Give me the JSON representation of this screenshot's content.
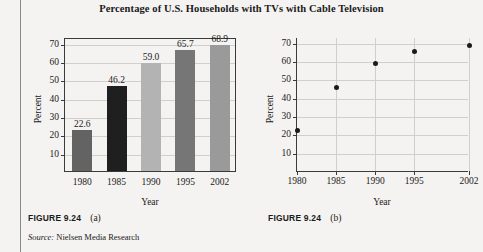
{
  "figure": {
    "title": "Percentage of U.S. Households with TVs with Cable Television",
    "caption_a": {
      "label": "FIGURE 9.24",
      "part": "(a)"
    },
    "caption_b": {
      "label": "FIGURE 9.24",
      "part": "(b)"
    },
    "source": {
      "word": "Source:",
      "text": " Nielsen Media Research"
    },
    "page_background": "#f4f3f1",
    "ink_color": "#1a1a1a"
  },
  "chart_data": [
    {
      "type": "bar",
      "id": "figure-9-24-a",
      "title": "Percentage of U.S. Households with TVs with Cable Television",
      "categories": [
        "1980",
        "1985",
        "1990",
        "1995",
        "2002"
      ],
      "values": [
        22.6,
        46.2,
        59.0,
        65.7,
        68.9
      ],
      "data_labels": [
        "22.6",
        "46.2",
        "59.0",
        "65.7",
        "68.9"
      ],
      "bar_colors": [
        "#636363",
        "#1f1f1f",
        "#b3b3b3",
        "#767676",
        "#9a9a9a"
      ],
      "xlabel": "Year",
      "ylabel": "Percent",
      "ylim": [
        0,
        73
      ],
      "yticks": [
        10,
        20,
        30,
        40,
        50,
        60,
        70
      ],
      "ytick_labels": [
        "10",
        "20",
        "30",
        "40",
        "50",
        "60",
        "70"
      ],
      "grid": true,
      "grid_axis": "y",
      "legend": "none"
    },
    {
      "type": "scatter",
      "id": "figure-9-24-b",
      "title": "Percentage of U.S. Households with TVs with Cable Television",
      "x": [
        1980,
        1985,
        1990,
        1995,
        2002
      ],
      "y": [
        22.6,
        46.2,
        59.0,
        65.7,
        68.9
      ],
      "xtick_labels": [
        "1980",
        "1985",
        "1990",
        "1995",
        "2002"
      ],
      "xlabel": "Year",
      "ylabel": "Percent",
      "ylim": [
        0,
        73
      ],
      "xlim": [
        1980,
        2002
      ],
      "yticks": [
        10,
        20,
        30,
        40,
        50,
        60,
        70
      ],
      "ytick_labels": [
        "10",
        "20",
        "30",
        "40",
        "50",
        "60",
        "70"
      ],
      "marker_color": "#1b1b1b",
      "grid": true,
      "grid_axis": "both",
      "legend": "none"
    }
  ]
}
